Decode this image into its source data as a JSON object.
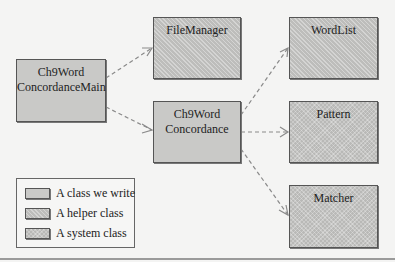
{
  "diagram": {
    "classes": {
      "main": {
        "line1": "Ch9Word",
        "line2": "ConcordanceMain",
        "kind": "ours"
      },
      "file_manager": {
        "line1": "FileManager",
        "kind": "helper"
      },
      "concordance": {
        "line1": "Ch9Word",
        "line2": "Concordance",
        "kind": "ours"
      },
      "word_list": {
        "line1": "WordList",
        "kind": "helper"
      },
      "pattern": {
        "line1": "Pattern",
        "kind": "system"
      },
      "matcher": {
        "line1": "Matcher",
        "kind": "system"
      }
    },
    "dependencies": [
      {
        "from": "Ch9WordConcordanceMain",
        "to": "FileManager"
      },
      {
        "from": "Ch9WordConcordanceMain",
        "to": "Ch9WordConcordance"
      },
      {
        "from": "Ch9WordConcordance",
        "to": "WordList"
      },
      {
        "from": "Ch9WordConcordance",
        "to": "Pattern"
      },
      {
        "from": "Ch9WordConcordance",
        "to": "Matcher"
      }
    ],
    "legend": {
      "items": [
        {
          "label": "A class we write",
          "kind": "ours"
        },
        {
          "label": "A helper class",
          "kind": "helper"
        },
        {
          "label": "A system class",
          "kind": "system"
        }
      ]
    },
    "colors": {
      "background": "#f4f4f3",
      "box_fill": "#c9c9c7",
      "border": "#555555",
      "arrow": "#8a8a8a"
    }
  }
}
